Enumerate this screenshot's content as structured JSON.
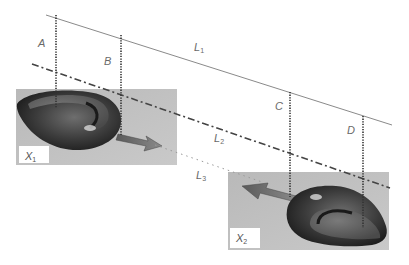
{
  "figure": {
    "lines": [
      {
        "id": "L1",
        "label": "L",
        "sub": "1",
        "style": "solid",
        "color": "#8a8a8a"
      },
      {
        "id": "L2",
        "label": "L",
        "sub": "2",
        "style": "dash-dot",
        "color": "#444444"
      },
      {
        "id": "L3",
        "label": "L",
        "sub": "3",
        "style": "dotted",
        "color": "#9a9a9a"
      }
    ],
    "markers": [
      {
        "id": "A",
        "label": "A"
      },
      {
        "id": "B",
        "label": "B"
      },
      {
        "id": "C",
        "label": "C"
      },
      {
        "id": "D",
        "label": "D"
      }
    ],
    "photos": [
      {
        "id": "X1",
        "label": "X",
        "sub": "1",
        "arrow_direction": "right"
      },
      {
        "id": "X2",
        "label": "X",
        "sub": "2",
        "arrow_direction": "left"
      }
    ]
  }
}
